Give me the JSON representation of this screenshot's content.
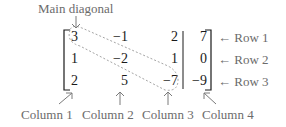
{
  "diagram": {
    "title_label": "Main diagonal",
    "matrix": {
      "rows": [
        [
          "3",
          "−1",
          "2",
          "7"
        ],
        [
          "1",
          "−2",
          "1",
          "0"
        ],
        [
          "2",
          "5",
          "−7",
          "−9"
        ]
      ],
      "augmented_divider_after_column": 3,
      "main_diagonal": [
        "3",
        "−2",
        "−7"
      ]
    },
    "row_labels": [
      "Row 1",
      "Row 2",
      "Row 3"
    ],
    "column_labels": [
      "Column 1",
      "Column 2",
      "Column 3",
      "Column 4"
    ],
    "row_arrow_glyph": "←",
    "colors": {
      "entries": "#1a1a1a",
      "labels": "#6b6b6b",
      "arrows": "#7a7a7a",
      "diagonal_outline": "#9a9a9a"
    }
  }
}
